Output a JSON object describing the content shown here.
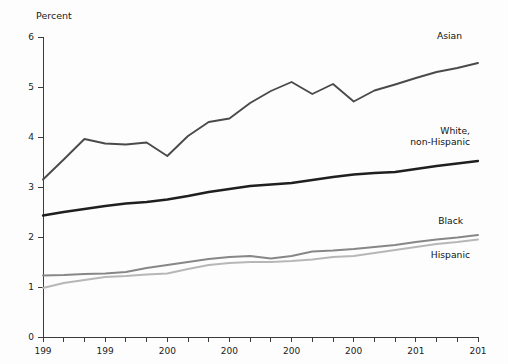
{
  "chart_data": {
    "type": "line",
    "title": "",
    "xlabel": "",
    "ylabel": "Percent",
    "ylim": [
      0,
      6
    ],
    "xlim": [
      1990,
      2011
    ],
    "grid": false,
    "legend_position": "right-inline-labels",
    "ytick_labels": [
      "0",
      "1",
      "2",
      "3",
      "4",
      "5",
      "6"
    ],
    "ytick_values": [
      0,
      1,
      2,
      3,
      4,
      5,
      6
    ],
    "x": [
      1990,
      1991,
      1992,
      1993,
      1994,
      1995,
      1996,
      1997,
      1998,
      1999,
      2000,
      2001,
      2002,
      2003,
      2004,
      2005,
      2006,
      2007,
      2008,
      2009,
      2010,
      2011
    ],
    "xtick_labels": [
      "199",
      "199",
      "200",
      "200",
      "200",
      "200",
      "201",
      "201"
    ],
    "xtick_label_values": [
      1990,
      1993,
      1996,
      1999,
      2002,
      2005,
      2008,
      2011
    ],
    "xtick_note": "Year labels are truncated in the image, showing only the first three digits",
    "series": [
      {
        "name": "Asian",
        "color": "#4a4a4a",
        "width": 1.9,
        "label": "Asian",
        "values": [
          3.15,
          3.55,
          3.96,
          3.87,
          3.85,
          3.89,
          3.62,
          4.02,
          4.3,
          4.37,
          4.68,
          4.92,
          5.1,
          4.86,
          5.06,
          4.71,
          4.93,
          5.05,
          5.18,
          5.3,
          5.38,
          5.48
        ]
      },
      {
        "name": "White, non-Hispanic",
        "color": "#1f1f1f",
        "width": 2.3,
        "label": "White,\nnon-Hispanic",
        "label_line1": "White,",
        "label_line2": "non-Hispanic",
        "values": [
          2.43,
          2.5,
          2.56,
          2.62,
          2.67,
          2.7,
          2.75,
          2.82,
          2.9,
          2.96,
          3.02,
          3.05,
          3.08,
          3.14,
          3.2,
          3.25,
          3.28,
          3.3,
          3.36,
          3.42,
          3.47,
          3.52
        ]
      },
      {
        "name": "Black",
        "color": "#878787",
        "width": 1.9,
        "label": "Black",
        "values": [
          1.23,
          1.24,
          1.26,
          1.27,
          1.3,
          1.38,
          1.44,
          1.5,
          1.56,
          1.6,
          1.62,
          1.57,
          1.62,
          1.71,
          1.73,
          1.76,
          1.8,
          1.84,
          1.9,
          1.95,
          1.99,
          2.04
        ]
      },
      {
        "name": "Hispanic",
        "color": "#b7b7b7",
        "width": 1.9,
        "label": "Hispanic",
        "values": [
          0.98,
          1.08,
          1.14,
          1.2,
          1.22,
          1.25,
          1.27,
          1.36,
          1.44,
          1.48,
          1.5,
          1.5,
          1.52,
          1.55,
          1.6,
          1.62,
          1.68,
          1.74,
          1.8,
          1.86,
          1.9,
          1.95
        ]
      }
    ]
  },
  "axis": {
    "y_title": "Percent"
  }
}
